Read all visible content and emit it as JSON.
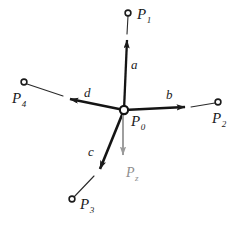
{
  "figure": {
    "background_color": "#ffffff",
    "ink_color": "#1b1b1b",
    "accent_gray": "#8e8e8e",
    "width": 242,
    "height": 225
  },
  "hub": {
    "label_base": "P",
    "label_sub": "0",
    "x": 124,
    "y": 110
  },
  "nodes": [
    {
      "id": "P1",
      "label_base": "P",
      "label_sub": "1",
      "x": 128,
      "y": 13,
      "label_x": 137,
      "label_y": 6
    },
    {
      "id": "P2",
      "label_base": "P",
      "label_sub": "2",
      "x": 218,
      "y": 102,
      "label_x": 212,
      "label_y": 110
    },
    {
      "id": "P3",
      "label_base": "P",
      "label_sub": "3",
      "x": 72,
      "y": 199,
      "label_x": 80,
      "label_y": 196
    },
    {
      "id": "P4",
      "label_base": "P",
      "label_sub": "4",
      "x": 24,
      "y": 82,
      "label_x": 12,
      "label_y": 90
    }
  ],
  "vectors": [
    {
      "id": "a",
      "label": "a",
      "to_node": "P1",
      "tip_x": 127,
      "tip_y": 33,
      "label_x": 131,
      "label_y": 58
    },
    {
      "id": "b",
      "label": "b",
      "to_node": "P2",
      "tip_x": 192,
      "tip_y": 108,
      "label_x": 166,
      "label_y": 88
    },
    {
      "id": "c",
      "label": "c",
      "to_node": "P3",
      "tip_x": 95,
      "tip_y": 175,
      "label_x": 88,
      "label_y": 145
    },
    {
      "id": "d",
      "label": "d",
      "to_node": "P4",
      "tip_x": 62,
      "tip_y": 96,
      "label_x": 84,
      "label_y": 86
    }
  ],
  "load_vector": {
    "id": "Pz",
    "label_base": "P",
    "label_sub": "z",
    "tip_x": 123,
    "tip_y": 162,
    "label_x": 126,
    "label_y": 164,
    "color": "#8e8e8e"
  }
}
